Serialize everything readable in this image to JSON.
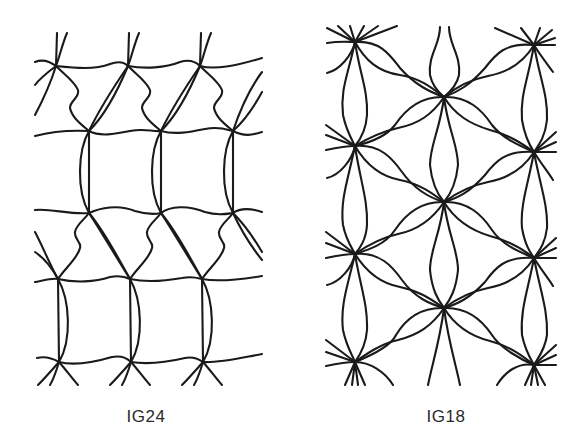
{
  "figures": [
    {
      "id": "left",
      "label": "IG24",
      "pattern_description": "Grid mesh with diagonal twisted ties; horizontal wavy lines with vertical bowed connectors"
    },
    {
      "id": "right",
      "label": "IG18",
      "pattern_description": "Star-node mesh with petal-shaped curved connectors in a hexagonal arrangement"
    }
  ],
  "colors": {
    "line": "#1a1a1a",
    "background": "#ffffff",
    "caption": "#2a2a2a"
  }
}
